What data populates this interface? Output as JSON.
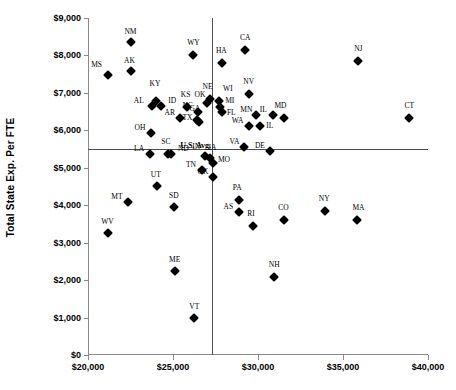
{
  "chart_data": {
    "type": "scatter",
    "title": "",
    "xlabel": "",
    "ylabel": "Total State Exp. Per FTE",
    "xlim": [
      20000,
      40000
    ],
    "ylim": [
      0,
      9000
    ],
    "x_ticks": [
      "$20,000",
      "$25,000",
      "$30,000",
      "$35,000",
      "$40,000"
    ],
    "x_tick_values": [
      20000,
      25000,
      30000,
      35000,
      40000
    ],
    "y_ticks": [
      "$0",
      "$1,000",
      "$2,000",
      "$3,000",
      "$4,000",
      "$5,000",
      "$6,000",
      "$7,000",
      "$8,000",
      "$9,000"
    ],
    "y_tick_values": [
      0,
      1000,
      2000,
      3000,
      4000,
      5000,
      6000,
      7000,
      8000,
      9000
    ],
    "grid": false,
    "legend": "none",
    "reference_lines": {
      "label": "U.S. Avg.",
      "horizontal_y": 5500,
      "vertical_x": 27300
    },
    "point_color": "#000000",
    "marker": "diamond",
    "points": [
      {
        "label": "MS",
        "x": 21150,
        "y": 7490,
        "lx": -11,
        "ly": -6
      },
      {
        "label": "NM",
        "x": 22500,
        "y": 8350,
        "lx": 0,
        "ly": -6
      },
      {
        "label": "AK",
        "x": 22500,
        "y": 7590,
        "lx": -1,
        "ly": -6
      },
      {
        "label": "KY",
        "x": 24000,
        "y": 6790,
        "lx": -1,
        "ly": -13
      },
      {
        "label": "AL",
        "x": 23750,
        "y": 6650,
        "lx": -13,
        "ly": -1
      },
      {
        "label": "ID",
        "x": 24300,
        "y": 6640,
        "lx": 11,
        "ly": -1
      },
      {
        "label": "OH",
        "x": 23700,
        "y": 5920,
        "lx": -11,
        "ly": -1
      },
      {
        "label": "SC",
        "x": 24700,
        "y": 5380,
        "lx": -2,
        "ly": -8
      },
      {
        "label": "LA",
        "x": 23650,
        "y": 5370,
        "lx": -11,
        "ly": -1
      },
      {
        "label": "ND",
        "x": 24900,
        "y": 5360,
        "lx": 12,
        "ly": -1
      },
      {
        "label": "UT",
        "x": 24050,
        "y": 4510,
        "lx": -1,
        "ly": -7
      },
      {
        "label": "MT",
        "x": 22350,
        "y": 4090,
        "lx": -11,
        "ly": -1
      },
      {
        "label": "SD",
        "x": 25050,
        "y": 3940,
        "lx": 0,
        "ly": -7
      },
      {
        "label": "WV",
        "x": 21200,
        "y": 3250,
        "lx": -1,
        "ly": -7
      },
      {
        "label": "ME",
        "x": 25100,
        "y": 2250,
        "lx": 0,
        "ly": -7
      },
      {
        "label": "VT",
        "x": 26250,
        "y": 980,
        "lx": 0,
        "ly": -7
      },
      {
        "label": "KS",
        "x": 25800,
        "y": 6620,
        "lx": -1,
        "ly": -8
      },
      {
        "label": "AR",
        "x": 25400,
        "y": 6330,
        "lx": -10,
        "ly": -1
      },
      {
        "label": "NC",
        "x": 26450,
        "y": 6500,
        "lx": -10,
        "ly": -2
      },
      {
        "label": "GA",
        "x": 26400,
        "y": 6270,
        "lx": -2,
        "ly": -7
      },
      {
        "label": "TX",
        "x": 26500,
        "y": 6230,
        "lx": -11,
        "ly": 0
      },
      {
        "label": "OK",
        "x": 27000,
        "y": 6720,
        "lx": -7,
        "ly": -4
      },
      {
        "label": "NE",
        "x": 27150,
        "y": 6850,
        "lx": -2,
        "ly": -8
      },
      {
        "label": "WI",
        "x": 27700,
        "y": 6780,
        "lx": 9,
        "ly": -8
      },
      {
        "label": "MI",
        "x": 27750,
        "y": 6620,
        "lx": 10,
        "ly": -2
      },
      {
        "label": "FL",
        "x": 27900,
        "y": 6500,
        "lx": 9,
        "ly": 5
      },
      {
        "label": "IN",
        "x": 26900,
        "y": 5310,
        "lx": -9,
        "ly": -5
      },
      {
        "label": "IA",
        "x": 27150,
        "y": 5250,
        "lx": 3,
        "ly": -6
      },
      {
        "label": "MO",
        "x": 27350,
        "y": 5140,
        "lx": 11,
        "ly": 1
      },
      {
        "label": "TN",
        "x": 26700,
        "y": 4930,
        "lx": -11,
        "ly": -1
      },
      {
        "label": "OK2",
        "x": 27350,
        "y": 4760,
        "lx": -10,
        "ly": -1
      },
      {
        "label": "WY",
        "x": 26200,
        "y": 8020,
        "lx": 0,
        "ly": -8
      },
      {
        "label": "HA",
        "x": 27900,
        "y": 7790,
        "lx": -1,
        "ly": -8
      },
      {
        "label": "CA",
        "x": 29250,
        "y": 8140,
        "lx": 0,
        "ly": -8
      },
      {
        "label": "NJ",
        "x": 35900,
        "y": 7850,
        "lx": 0,
        "ly": -8
      },
      {
        "label": "NV",
        "x": 29450,
        "y": 6970,
        "lx": 0,
        "ly": -8
      },
      {
        "label": "MN",
        "x": 29900,
        "y": 6400,
        "lx": -10,
        "ly": -1
      },
      {
        "label": "IL",
        "x": 30900,
        "y": 6420,
        "lx": -10,
        "ly": -1
      },
      {
        "label": "MD",
        "x": 31500,
        "y": 6330,
        "lx": -3,
        "ly": -8
      },
      {
        "label": "WA",
        "x": 29450,
        "y": 6110,
        "lx": -11,
        "ly": -1
      },
      {
        "label": "IL2",
        "x": 30100,
        "y": 6110,
        "lx": 10,
        "ly": 4
      },
      {
        "label": "VA",
        "x": 29200,
        "y": 5560,
        "lx": -10,
        "ly": -1
      },
      {
        "label": "DE",
        "x": 30700,
        "y": 5450,
        "lx": -10,
        "ly": -1
      },
      {
        "label": "CT",
        "x": 38900,
        "y": 6340,
        "lx": 0,
        "ly": -8
      },
      {
        "label": "PA",
        "x": 28900,
        "y": 4130,
        "lx": -2,
        "ly": -8
      },
      {
        "label": "AS",
        "x": 28900,
        "y": 3830,
        "lx": -11,
        "ly": -1
      },
      {
        "label": "RI",
        "x": 29700,
        "y": 3450,
        "lx": -2,
        "ly": -8
      },
      {
        "label": "CO",
        "x": 31550,
        "y": 3600,
        "lx": -1,
        "ly": -8
      },
      {
        "label": "NH",
        "x": 30950,
        "y": 2080,
        "lx": 0,
        "ly": -8
      },
      {
        "label": "NY",
        "x": 33950,
        "y": 3840,
        "lx": -1,
        "ly": -8
      },
      {
        "label": "MA",
        "x": 35850,
        "y": 3600,
        "lx": 1,
        "ly": -8
      }
    ]
  }
}
